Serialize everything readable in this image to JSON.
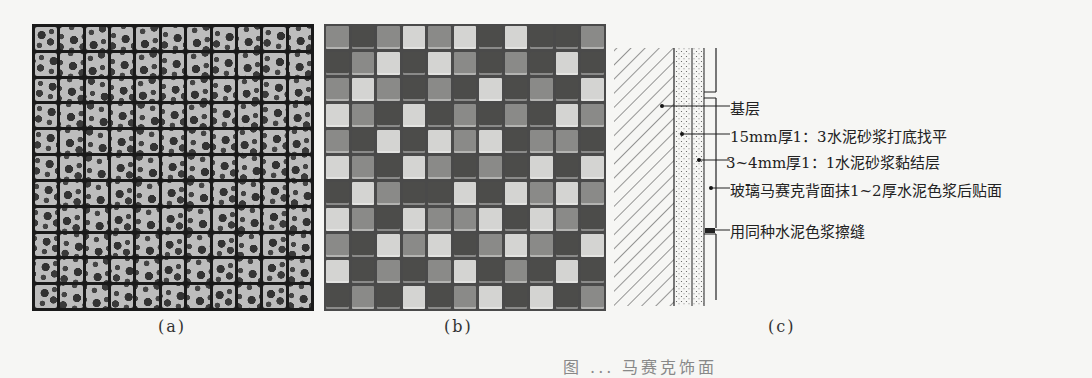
{
  "panels": {
    "a": {
      "caption": "(a)",
      "description": "Ceramic mosaic with floral pattern, 11x11 tile grid"
    },
    "b": {
      "caption": "(b)",
      "description": "Glass mosaic checkerboard of light/medium/dark tiles, 11x11 grid"
    },
    "c": {
      "caption": "(c)",
      "description": "Wall section construction detail for glass mosaic",
      "labels": [
        "基层",
        "15mm厚1：3水泥砂浆打底找平",
        "3~4mm厚1：1水泥砂浆黏结层",
        "玻璃马赛克背面抹1~2厚水泥色浆后贴面",
        "用同种水泥色浆擦缝"
      ]
    }
  },
  "figure_title": "图 ... 马赛克饰面",
  "mosaic_b_shades": [
    [
      2,
      1,
      2,
      3,
      2,
      3,
      1,
      3,
      1,
      1,
      2
    ],
    [
      1,
      2,
      3,
      1,
      3,
      2,
      1,
      2,
      1,
      3,
      1
    ],
    [
      2,
      3,
      2,
      1,
      2,
      1,
      3,
      1,
      2,
      1,
      3
    ],
    [
      3,
      2,
      1,
      3,
      1,
      2,
      1,
      2,
      1,
      3,
      2
    ],
    [
      2,
      1,
      3,
      1,
      3,
      2,
      3,
      1,
      2,
      2,
      1
    ],
    [
      3,
      2,
      1,
      3,
      2,
      1,
      2,
      1,
      3,
      1,
      3
    ],
    [
      1,
      3,
      2,
      1,
      1,
      3,
      1,
      3,
      2,
      3,
      2
    ],
    [
      3,
      2,
      1,
      3,
      2,
      2,
      3,
      1,
      3,
      2,
      1
    ],
    [
      2,
      1,
      3,
      2,
      3,
      1,
      2,
      3,
      2,
      1,
      3
    ],
    [
      3,
      1,
      2,
      1,
      2,
      3,
      1,
      2,
      1,
      3,
      1
    ],
    [
      1,
      2,
      1,
      3,
      1,
      2,
      3,
      1,
      3,
      1,
      2
    ]
  ],
  "colors": {
    "light": "#d4d4d2",
    "mid": "#8a8a88",
    "dark": "#4c4c4a"
  }
}
